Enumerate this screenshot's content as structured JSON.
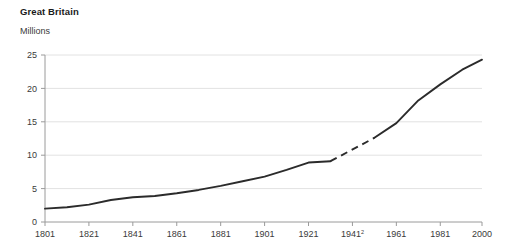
{
  "chart_data": {
    "type": "line",
    "title": "Great Britain",
    "ylabel": "Millions",
    "xlabel": "",
    "ylim": [
      0,
      25
    ],
    "xlim": [
      1801,
      2000
    ],
    "grid": true,
    "legend": false,
    "y_ticks": [
      0,
      5,
      10,
      15,
      20,
      25
    ],
    "y_tick_labels": [
      "0",
      "5",
      "10",
      "15",
      "20",
      "25"
    ],
    "x_ticks": [
      1801,
      1821,
      1841,
      1861,
      1881,
      1901,
      1921,
      1941,
      1961,
      1981,
      2000
    ],
    "x_tick_labels": [
      "1801",
      "1821",
      "1841",
      "1861",
      "1881",
      "1901",
      "1921",
      "1941",
      "1961",
      "1981",
      "2000"
    ],
    "x_tick_superscripts": [
      "",
      "",
      "",
      "",
      "",
      "",
      "",
      "2",
      "",
      "",
      ""
    ],
    "line_color": "#2b2b2b",
    "grid_color": "#e2e2e2",
    "axis_color": "#9a9a9a",
    "series": [
      {
        "name": "Great Britain population",
        "x": [
          1801,
          1811,
          1821,
          1831,
          1841,
          1851,
          1861,
          1871,
          1881,
          1891,
          1901,
          1911,
          1921,
          1931,
          1951,
          1961,
          1971,
          1981,
          1991,
          2000
        ],
        "values": [
          2.0,
          2.2,
          2.6,
          3.3,
          3.7,
          3.9,
          4.3,
          4.8,
          5.4,
          6.1,
          6.8,
          7.8,
          8.9,
          9.1,
          12.6,
          14.8,
          18.2,
          20.6,
          22.8,
          24.3
        ],
        "style": "solid"
      }
    ],
    "dashed_segment": {
      "note": "interpolated gap between 1931 and 1951 (no 1941 census)",
      "x": [
        1931,
        1951
      ],
      "values": [
        9.1,
        12.6
      ]
    }
  }
}
